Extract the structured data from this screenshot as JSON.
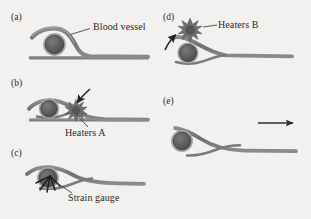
{
  "figure": {
    "background_color": "#f2f1ef",
    "ink_color": "#5b5b5b",
    "dark_ink_color": "#333333",
    "vessel_fill": "#5e5e5e",
    "vessel_ring": "#9a9a9a"
  },
  "panels": [
    {
      "id": "a",
      "tag": "(a)",
      "callout": "Blood vessel",
      "description": "Flexible strip draped over a blood vessel resting on a flat substrate"
    },
    {
      "id": "b",
      "tag": "(b)",
      "callout": "Heaters A",
      "description": "Strip curls around vessel, heaters A activated, arrow points to heating burst"
    },
    {
      "id": "c",
      "tag": "(c)",
      "callout": "Strain gauge",
      "description": "Strip fully wrapped around vessel with strain gauge indicated"
    },
    {
      "id": "d",
      "tag": "(d)",
      "callout": "Heaters B",
      "description": "Heaters B activated above the vessel, arrow points to heating burst"
    },
    {
      "id": "e",
      "tag": "(e)",
      "callout": "",
      "description": "Strip releases and retracts, motion arrow points to the right"
    }
  ],
  "annotations": {
    "motion_arrow": "rightward-motion-arrow",
    "heater_burst_a": "heater-burst-icon",
    "heater_burst_b": "heater-burst-icon",
    "pointer_arrow_b": "pointer-arrow-icon",
    "pointer_arrow_d": "pointer-arrow-icon",
    "leader_line_a": "leader-line",
    "leader_line_b": "leader-line",
    "leader_line_c": "leader-line",
    "leader_line_d": "leader-line"
  }
}
